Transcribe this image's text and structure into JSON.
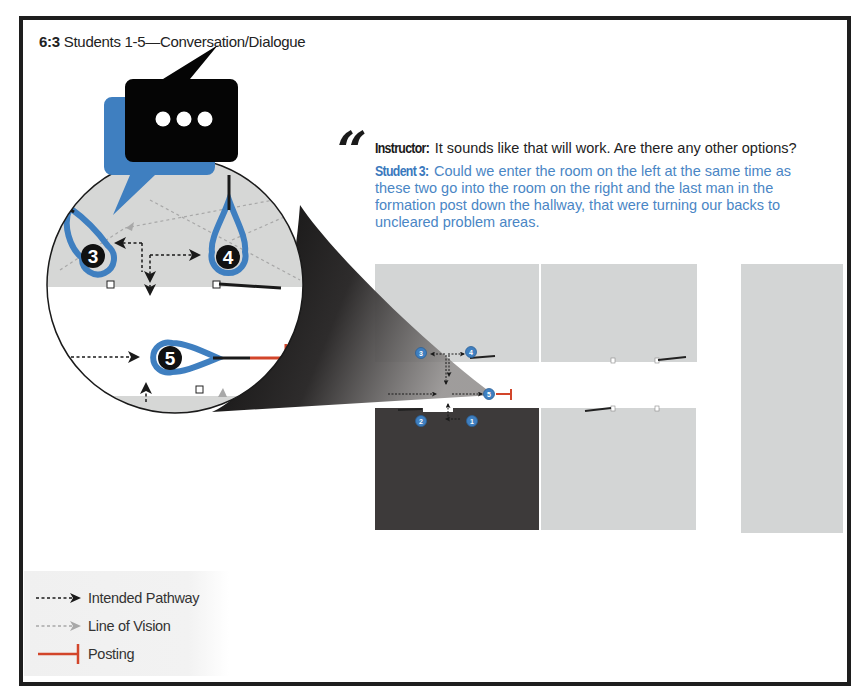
{
  "figure": {
    "number": "6:3",
    "title": "Students 1-5—Conversation/Dialogue"
  },
  "dialogue": {
    "quote_mark": "“",
    "instructor": {
      "speaker": "Instructor:",
      "text": "It sounds like that will work. Are there any other options?"
    },
    "student": {
      "speaker": "Student 3:",
      "lines": [
        "Could we enter the room on the left at the same time as",
        "these two go into the room on the right and the last man in the",
        "formation post down the hallway, that were turning our backs to",
        "uncleared problem areas."
      ]
    }
  },
  "diagram": {
    "speech_icon": "chat-bubble-ellipsis-icon",
    "magnifier_students": [
      "3",
      "4",
      "5"
    ],
    "map_students": [
      "1",
      "2",
      "3",
      "4",
      "5"
    ],
    "colors": {
      "student_blue": "#3f7fc0",
      "room_gray": "#d3d5d5",
      "room_dark": "#3d3a3a",
      "posting_red": "#d2452a",
      "pathway": "#1a1a1a",
      "vision": "#a8a8a8"
    }
  },
  "legend": {
    "items": [
      {
        "label": "Intended Pathway",
        "icon": "dashed-arrow-black"
      },
      {
        "label": "Line of Vision",
        "icon": "dashed-arrow-gray"
      },
      {
        "label": "Posting",
        "icon": "red-t-bar"
      }
    ]
  }
}
